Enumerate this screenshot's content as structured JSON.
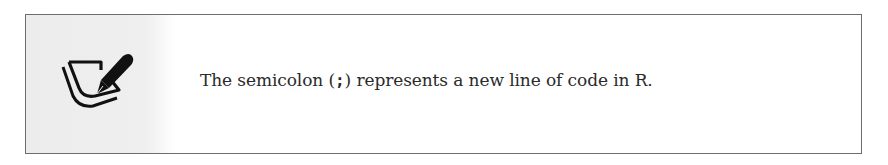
{
  "note": {
    "icon": "note-pen-icon",
    "text_before": "The semicolon (",
    "code": ";",
    "text_after": ") represents a new line of code in R."
  },
  "colors": {
    "border": "#6e6e6e",
    "icon_panel": "#ececec",
    "text": "#2a2a2a"
  }
}
